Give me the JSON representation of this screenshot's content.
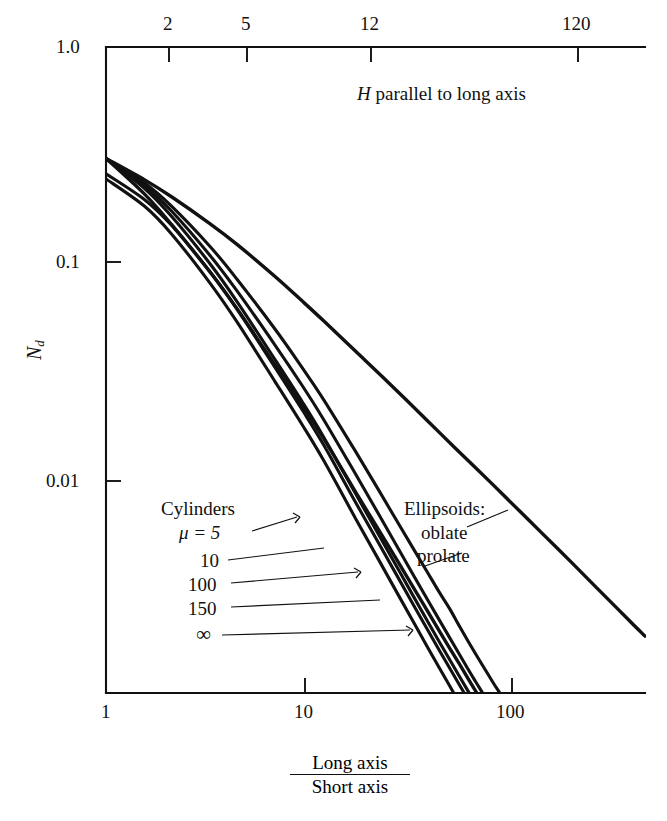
{
  "figure": {
    "background": "#ffffff",
    "ink_color": "#111111"
  },
  "chart_data": {
    "type": "line",
    "title": "",
    "subtitle": "",
    "annotation_top": "H parallel to long axis",
    "xlabel_numerator": "Long axis",
    "xlabel_denominator": "Short axis",
    "ylabel": "Nd",
    "ylabel_base": "N",
    "ylabel_sub": "d",
    "xscale": "log",
    "yscale": "log",
    "xlim": [
      1,
      300
    ],
    "ylim": [
      0.0017,
      1.0
    ],
    "grid": false,
    "legend_position": "inside-plot",
    "x_bottom_ticks": [
      {
        "value": 1,
        "label": "1"
      },
      {
        "value": 10,
        "label": "10"
      },
      {
        "value": 100,
        "label": "100"
      }
    ],
    "x_top_ticks": [
      {
        "value": 2,
        "label": "2"
      },
      {
        "value": 5,
        "label": "5"
      },
      {
        "value": 12,
        "label": "12"
      },
      {
        "value": 120,
        "label": "120"
      }
    ],
    "y_ticks": [
      {
        "value": 1.0,
        "label": "1.0"
      },
      {
        "value": 0.1,
        "label": "0.1"
      },
      {
        "value": 0.01,
        "label": "0.01"
      }
    ],
    "series": [
      {
        "name": "Cylinders mu = 5",
        "group": "cylinders",
        "legend_label": "μ = 5",
        "points": [
          [
            1.0,
            0.333
          ],
          [
            1.5,
            0.262
          ],
          [
            2.0,
            0.208
          ],
          [
            3.0,
            0.14
          ],
          [
            4.0,
            0.101
          ],
          [
            6.0,
            0.0615
          ],
          [
            8.0,
            0.042
          ],
          [
            10.0,
            0.0308
          ],
          [
            14.0,
            0.0185
          ],
          [
            18.0,
            0.0125
          ],
          [
            22.0,
            0.0091
          ],
          [
            26.0,
            0.007
          ],
          [
            30.0,
            0.0056
          ],
          [
            34.0,
            0.0046
          ],
          [
            38.0,
            0.0039
          ],
          [
            42.0,
            0.0033
          ],
          [
            46.0,
            0.00285
          ],
          [
            50.0,
            0.0025
          ],
          [
            54.0,
            0.00222
          ],
          [
            58.0,
            0.00199
          ],
          [
            62.0,
            0.0018
          ],
          [
            66.0,
            0.00165
          ],
          [
            70.0,
            0.00152
          ]
        ]
      },
      {
        "name": "Cylinders mu = 10",
        "group": "cylinders",
        "legend_label": "10",
        "points": [
          [
            1.0,
            0.333
          ],
          [
            1.5,
            0.255
          ],
          [
            2.0,
            0.198
          ],
          [
            3.0,
            0.128
          ],
          [
            4.0,
            0.09
          ],
          [
            6.0,
            0.0525
          ],
          [
            8.0,
            0.0352
          ],
          [
            10.0,
            0.0253
          ],
          [
            14.0,
            0.0148
          ],
          [
            18.0,
            0.00985
          ],
          [
            22.0,
            0.0071
          ],
          [
            26.0,
            0.0054
          ],
          [
            30.0,
            0.00428
          ],
          [
            34.0,
            0.0035
          ],
          [
            38.0,
            0.00293
          ],
          [
            42.0,
            0.0025
          ],
          [
            46.0,
            0.00216
          ],
          [
            50.0,
            0.0019
          ],
          [
            54.0,
            0.00169
          ],
          [
            58.0,
            0.00151
          ]
        ]
      },
      {
        "name": "Cylinders mu = 100",
        "group": "cylinders",
        "legend_label": "100",
        "points": [
          [
            1.0,
            0.333
          ],
          [
            1.5,
            0.248
          ],
          [
            2.0,
            0.188
          ],
          [
            3.0,
            0.118
          ],
          [
            4.0,
            0.081
          ],
          [
            6.0,
            0.0455
          ],
          [
            8.0,
            0.03
          ],
          [
            10.0,
            0.0213
          ],
          [
            14.0,
            0.0122
          ],
          [
            18.0,
            0.00805
          ],
          [
            22.0,
            0.00578
          ],
          [
            26.0,
            0.00438
          ],
          [
            30.0,
            0.00346
          ],
          [
            34.0,
            0.00282
          ],
          [
            38.0,
            0.00236
          ],
          [
            42.0,
            0.00201
          ],
          [
            46.0,
            0.00174
          ],
          [
            50.0,
            0.00152
          ],
          [
            53.0,
            0.00139
          ]
        ]
      },
      {
        "name": "Cylinders mu = 150",
        "group": "cylinders",
        "legend_label": "150",
        "points": [
          [
            1.0,
            0.286
          ],
          [
            1.5,
            0.222
          ],
          [
            2.0,
            0.172
          ],
          [
            3.0,
            0.109
          ],
          [
            4.0,
            0.0752
          ],
          [
            6.0,
            0.0421
          ],
          [
            8.0,
            0.0277
          ],
          [
            10.0,
            0.0197
          ],
          [
            14.0,
            0.0112
          ],
          [
            18.0,
            0.0074
          ],
          [
            22.0,
            0.00531
          ],
          [
            26.0,
            0.00402
          ],
          [
            30.0,
            0.00318
          ],
          [
            34.0,
            0.00259
          ],
          [
            38.0,
            0.00217
          ],
          [
            42.0,
            0.00185
          ],
          [
            46.0,
            0.0016
          ],
          [
            49.0,
            0.00145
          ]
        ]
      },
      {
        "name": "Cylinders mu = infinity",
        "group": "cylinders",
        "legend_label": "∞",
        "points": [
          [
            1.0,
            0.272
          ],
          [
            1.5,
            0.208
          ],
          [
            2.0,
            0.158
          ],
          [
            3.0,
            0.0975
          ],
          [
            4.0,
            0.0663
          ],
          [
            6.0,
            0.0366
          ],
          [
            8.0,
            0.0239
          ],
          [
            10.0,
            0.0169
          ],
          [
            14.0,
            0.00955
          ],
          [
            18.0,
            0.00628
          ],
          [
            22.0,
            0.00449
          ],
          [
            26.0,
            0.0034
          ],
          [
            30.0,
            0.00268
          ],
          [
            34.0,
            0.00218
          ],
          [
            38.0,
            0.00182
          ],
          [
            42.0,
            0.00155
          ],
          [
            44.0,
            0.00144
          ]
        ]
      },
      {
        "name": "Ellipsoids oblate",
        "group": "ellipsoids",
        "legend_label": "oblate",
        "points": [
          [
            1.0,
            0.333
          ],
          [
            1.5,
            0.27
          ],
          [
            2.0,
            0.228
          ],
          [
            3.0,
            0.175
          ],
          [
            4.0,
            0.1425
          ],
          [
            6.0,
            0.1035
          ],
          [
            8.0,
            0.0812
          ],
          [
            10.0,
            0.067
          ],
          [
            14.0,
            0.0497
          ],
          [
            20.0,
            0.0362
          ],
          [
            30.0,
            0.025
          ],
          [
            40.0,
            0.0192
          ],
          [
            60.0,
            0.0133
          ],
          [
            80.0,
            0.0102
          ],
          [
            100.0,
            0.0083
          ],
          [
            140.0,
            0.00608
          ],
          [
            180.0,
            0.0048
          ],
          [
            220.0,
            0.00398
          ],
          [
            260.0,
            0.0034
          ],
          [
            300.0,
            0.00298
          ]
        ]
      },
      {
        "name": "Ellipsoids prolate",
        "group": "ellipsoids",
        "legend_label": "prolate",
        "points": [
          [
            1.0,
            0.333
          ],
          [
            1.5,
            0.2345
          ],
          [
            2.0,
            0.1735
          ],
          [
            3.0,
            0.1087
          ],
          [
            4.0,
            0.0754
          ],
          [
            6.0,
            0.0432
          ],
          [
            8.0,
            0.029
          ],
          [
            10.0,
            0.021
          ],
          [
            14.0,
            0.0124
          ],
          [
            18.0,
            0.00845
          ],
          [
            22.0,
            0.0062
          ],
          [
            26.0,
            0.00478
          ],
          [
            30.0,
            0.00382
          ],
          [
            34.0,
            0.00314
          ],
          [
            38.0,
            0.00264
          ],
          [
            42.0,
            0.00227
          ],
          [
            46.0,
            0.00197
          ],
          [
            50.0,
            0.00173
          ],
          [
            55.0,
            0.00149
          ],
          [
            60.0,
            0.0013
          ]
        ]
      }
    ],
    "legend_cylinders": {
      "title": "Cylinders",
      "entries": [
        "μ = 5",
        "10",
        "100",
        "150",
        "∞"
      ]
    },
    "legend_ellipsoids": {
      "title": "Ellipsoids:",
      "entries": [
        "oblate",
        "prolate"
      ]
    }
  },
  "axes": {
    "top_annotation_italic": "H",
    "top_annotation_rest": " parallel to long axis"
  }
}
